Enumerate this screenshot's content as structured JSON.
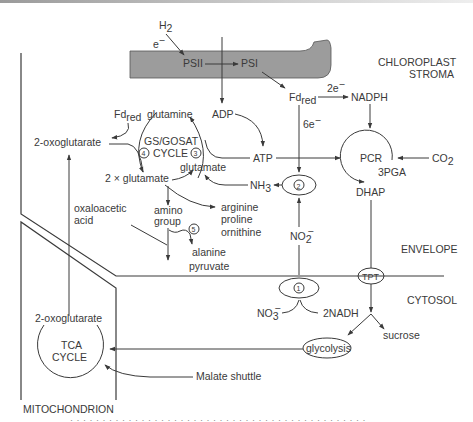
{
  "figure": {
    "regions": {
      "chloroplast_stroma": [
        "CHLOROPLAST",
        "STROMA"
      ],
      "envelope": "ENVELOPE",
      "cytosol": "CYTOSOL",
      "mitochondrion": "MITOCHONDRION"
    },
    "thylakoid": {
      "fill_color": "#9c9c9c",
      "psii": "PSII",
      "psi": "PSI"
    },
    "inputs": {
      "h2": "H",
      "h2_sub": "2",
      "electron": "e",
      "electron_sup": "−"
    },
    "stroma_labels": {
      "adp": "ADP",
      "atp": "ATP",
      "fd_red": "Fd",
      "fd_red_sub": "red",
      "fd_red_left": "Fd",
      "fd_red_left_sub": "red",
      "two_e": "2e",
      "two_e_sup": "−",
      "six_e": "6e",
      "six_e_sup": "−",
      "nadph": "NADPH",
      "pcr": "PCR",
      "co2": "CO",
      "co2_sub": "2",
      "three_pga": "3PGA",
      "dhap": "DHAP",
      "nh3": "NH",
      "nh3_sub": "3",
      "no2": "NO",
      "no2_sub": "2",
      "no2_sup": "−"
    },
    "gs_gogat": {
      "cycle_line1": "GS/GOSAT",
      "cycle_line2": "CYCLE",
      "glutamine": "glutamine",
      "glutamate": "glutamate",
      "two_glutamate": "2 × glutamate",
      "two_oxoglutarate": "2-oxoglutarate",
      "step3": "3",
      "step4": "4"
    },
    "amino_acids": {
      "products": [
        "arginine",
        "proline",
        "ornithine"
      ],
      "amino_group": [
        "amino",
        "group"
      ],
      "oxaloacetic_acid": [
        "oxaloacetic",
        "acid"
      ],
      "alanine_pyruvate": [
        "alanine",
        "pyruvate"
      ],
      "step5": "5"
    },
    "enzymes": {
      "step1": "1",
      "step2": "2",
      "tpt": "TPT"
    },
    "cytosol_labels": {
      "no3": "NO",
      "no3_sub": "3",
      "no3_sup": "−",
      "two_nadh": "2NADH",
      "sucrose": "sucrose",
      "glycolysis": "glycolysis",
      "malate_shuttle": "Malate shuttle"
    },
    "mitochondrion_labels": {
      "two_oxoglutarate": "2-oxoglutarate",
      "tca_line1": "TCA",
      "tca_line2": "CYCLE"
    },
    "caption_partial": "· · · · · · · · · · · · · · · · · · · · · · · · · · · · · · · · · · · · · · · · · · · · · ·"
  }
}
